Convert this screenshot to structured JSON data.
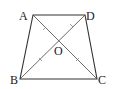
{
  "diagram": {
    "type": "geometry",
    "shape": "trapezoid",
    "vertices": {
      "A": {
        "label": "A",
        "x": 33,
        "y": 15
      },
      "D": {
        "label": "D",
        "x": 85,
        "y": 15
      },
      "B": {
        "label": "B",
        "x": 20,
        "y": 79
      },
      "C": {
        "label": "C",
        "x": 97,
        "y": 79
      }
    },
    "intersection": {
      "label": "O",
      "x": 57,
      "y": 42
    },
    "edges": [
      "AD",
      "DC",
      "CB",
      "BA"
    ],
    "diagonals": [
      "AC",
      "BD"
    ],
    "colors": {
      "line": "#333333",
      "label": "#222222",
      "background": "#ffffff"
    }
  }
}
